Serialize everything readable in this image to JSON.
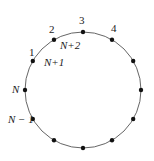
{
  "diagram": {
    "type": "ring-of-nodes",
    "node_count": 12,
    "colors": {
      "stroke": "#666666",
      "node": "#111111",
      "text": "#222222"
    },
    "labels": [
      {
        "node": 0,
        "text": "3"
      },
      {
        "node": 1,
        "text": "4"
      },
      {
        "node": 11,
        "text": "2"
      },
      {
        "node": 10,
        "text": "1"
      },
      {
        "node": 9,
        "text": "N"
      },
      {
        "node": 8,
        "text": "N − 1"
      },
      {
        "node": 11,
        "text": "N+2",
        "inner": true
      },
      {
        "node": 10,
        "text": "N+1",
        "inner": true
      }
    ]
  }
}
